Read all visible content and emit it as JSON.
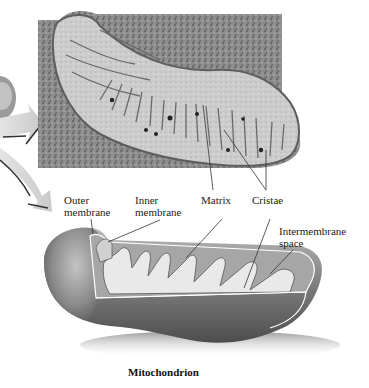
{
  "figure": {
    "title": "Mitochondrion",
    "labels": {
      "outer_membrane": [
        "Outer",
        "membrane"
      ],
      "inner_membrane": [
        "Inner",
        "membrane"
      ],
      "matrix": "Matrix",
      "cristae": "Cristae",
      "intermembrane_space": [
        "Intermembrane",
        "space"
      ]
    },
    "panels": {
      "micrograph": "electron micrograph of mitochondrion",
      "illustration": "3D cutaway illustration of mitochondrion"
    },
    "colors": {
      "background": "#ffffff",
      "micrograph_dark": "#6e6e6e",
      "micrograph_light": "#c8c8c8",
      "organelle_shell": "#8a8a8a",
      "organelle_inner": "#e8e8e8",
      "arrow": "#d9d9d9",
      "leader_line": "#333333"
    }
  }
}
